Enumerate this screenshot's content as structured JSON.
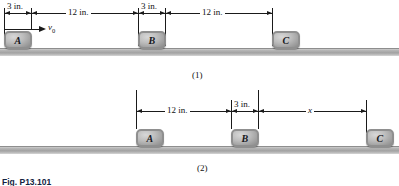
{
  "figure": {
    "caption": "Fig. P13.101",
    "panels": [
      {
        "id": "panel-1",
        "caption": "(1)",
        "velocity_label_base": "v",
        "velocity_label_sub": "0",
        "blocks": [
          {
            "label": "A"
          },
          {
            "label": "B"
          },
          {
            "label": "C"
          }
        ],
        "dimensions": [
          {
            "label": "3 in."
          },
          {
            "label": "12 in."
          },
          {
            "label": "3 in."
          },
          {
            "label": "12 in."
          }
        ]
      },
      {
        "id": "panel-2",
        "caption": "(2)",
        "blocks": [
          {
            "label": "A"
          },
          {
            "label": "B"
          },
          {
            "label": "C"
          }
        ],
        "dimensions": [
          {
            "label": "12 in."
          },
          {
            "label": "3 in."
          },
          {
            "label": "x"
          }
        ]
      }
    ]
  },
  "colors": {
    "ground": "#a2a2a2",
    "block_face": "#bdbdbd",
    "block_edge": "#8f8f8f",
    "line": "#1a1a1a",
    "caption_text": "#14233f"
  }
}
